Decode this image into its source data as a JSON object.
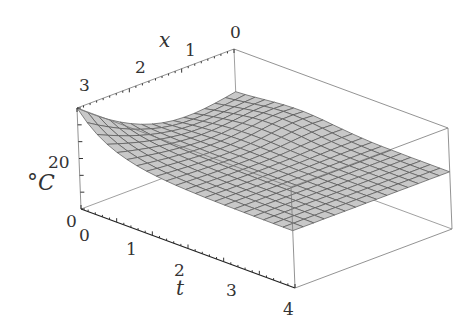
{
  "chart_data": {
    "type": "surface3d",
    "title": "",
    "axes": {
      "x": {
        "label": "x",
        "ticks": [
          "0",
          "1",
          "2",
          "3"
        ],
        "range": [
          0,
          3
        ]
      },
      "t": {
        "label": "t",
        "ticks": [
          "0",
          "1",
          "2",
          "3",
          "4"
        ],
        "range": [
          0,
          4
        ]
      },
      "z": {
        "label": "°C",
        "ticks": [
          "0",
          "20"
        ],
        "range": [
          0,
          30
        ]
      }
    },
    "surface_samples": {
      "x": [
        0,
        1,
        2,
        3
      ],
      "t": [
        0,
        1,
        2,
        3,
        4
      ],
      "values": [
        [
          18,
          18,
          17,
          17,
          17
        ],
        [
          22,
          19,
          18,
          17,
          17
        ],
        [
          26,
          20,
          18,
          17,
          17
        ],
        [
          30,
          21,
          18,
          17,
          16
        ]
      ]
    },
    "grid": false,
    "box": true
  },
  "labels": {
    "x_label": "x",
    "t_label": "t",
    "z_label": "°C",
    "x_ticks": [
      "0",
      "1",
      "2",
      "3"
    ],
    "t_ticks": [
      "0",
      "1",
      "2",
      "3",
      "4"
    ],
    "z_ticks": [
      "0",
      "20"
    ]
  }
}
